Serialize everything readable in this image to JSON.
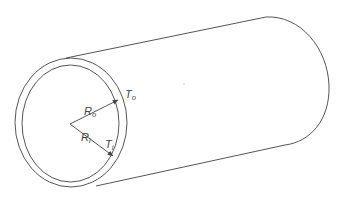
{
  "diagram": {
    "title": "",
    "labels": {
      "outer_radius": {
        "main": "R",
        "sub": "o"
      },
      "inner_radius": {
        "main": "R",
        "sub": "i"
      },
      "outer_thickness": {
        "main": "T",
        "sub": "o"
      },
      "inner_thickness": {
        "main": "T",
        "sub": "i"
      }
    },
    "colors": {
      "line": "#555555",
      "text": "#444444",
      "background": "#ffffff"
    }
  }
}
